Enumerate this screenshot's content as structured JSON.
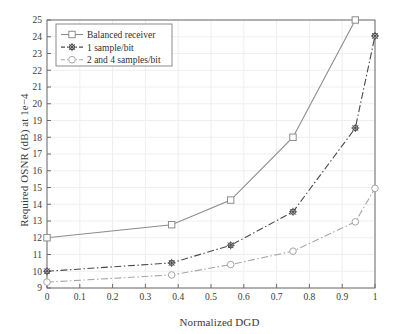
{
  "chart_data": {
    "type": "line",
    "title": "",
    "xlabel": "Normalized DGD",
    "ylabel": "Required OSNR (dB) at 1e−4",
    "xlim": [
      0,
      1
    ],
    "ylim": [
      9,
      25
    ],
    "grid": true,
    "legend_position": "top-left",
    "xticks": [
      "0",
      "0.1",
      "0.2",
      "0.3",
      "0.4",
      "0.5",
      "0.6",
      "0.7",
      "0.8",
      "0.9",
      "1"
    ],
    "xtick_values": [
      0,
      0.1,
      0.2,
      0.3,
      0.4,
      0.5,
      0.6,
      0.7,
      0.8,
      0.9,
      1
    ],
    "yticks": [
      "9",
      "10",
      "11",
      "12",
      "13",
      "14",
      "15",
      "16",
      "17",
      "18",
      "19",
      "20",
      "21",
      "22",
      "23",
      "24",
      "25"
    ],
    "ytick_values": [
      9,
      10,
      11,
      12,
      13,
      14,
      15,
      16,
      17,
      18,
      19,
      20,
      21,
      22,
      23,
      24,
      25
    ],
    "series": [
      {
        "name": "Balanced receiver",
        "marker": "square",
        "line_style": "solid",
        "color": "#8c8c8c",
        "x": [
          0,
          0.38,
          0.56,
          0.75,
          0.94
        ],
        "values": [
          12.0,
          12.78,
          14.25,
          18.0,
          25.0
        ]
      },
      {
        "name": "1 sample/bit",
        "marker": "star",
        "line_style": "dashdot",
        "color": "#4a4a4a",
        "x": [
          0,
          0.38,
          0.56,
          0.75,
          0.94,
          1.0
        ],
        "values": [
          10.0,
          10.5,
          11.55,
          13.55,
          18.55,
          24.05
        ]
      },
      {
        "name": "2 and 4 samples/bit",
        "marker": "circle",
        "line_style": "dashdot",
        "color": "#a6a6a6",
        "x": [
          0,
          0.38,
          0.56,
          0.75,
          0.94,
          1.0
        ],
        "values": [
          9.35,
          9.78,
          10.4,
          11.2,
          12.95,
          14.95
        ]
      }
    ]
  },
  "figure": {
    "x_axis_label": "Normalized DGD",
    "y_axis_label": "Required OSNR (dB) at 1e−4"
  },
  "legend": {
    "items": [
      {
        "label": "Balanced receiver"
      },
      {
        "label": "1 sample/bit"
      },
      {
        "label": "2 and 4 samples/bit"
      }
    ]
  },
  "colors": {
    "axis": "#6b6b6b",
    "grid": "#eeeeee",
    "series_1": "#8c8c8c",
    "series_2": "#4a4a4a",
    "series_3": "#a6a6a6",
    "text": "#3a3a3a"
  }
}
